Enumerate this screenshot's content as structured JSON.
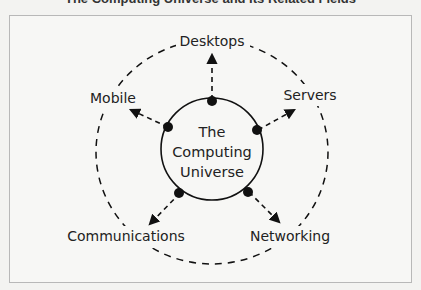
{
  "caption": "The Computing Universe and Its Related Fields",
  "diagram": {
    "center": {
      "lines": [
        "The",
        "Computing",
        "Universe"
      ]
    },
    "nodes": [
      {
        "label": "Desktops"
      },
      {
        "label": "Servers"
      },
      {
        "label": "Networking"
      },
      {
        "label": "Communications"
      },
      {
        "label": "Mobile"
      }
    ],
    "colors": {
      "stroke": "#111111",
      "background": "#f7f7f5",
      "border": "#b8b8b8"
    }
  }
}
